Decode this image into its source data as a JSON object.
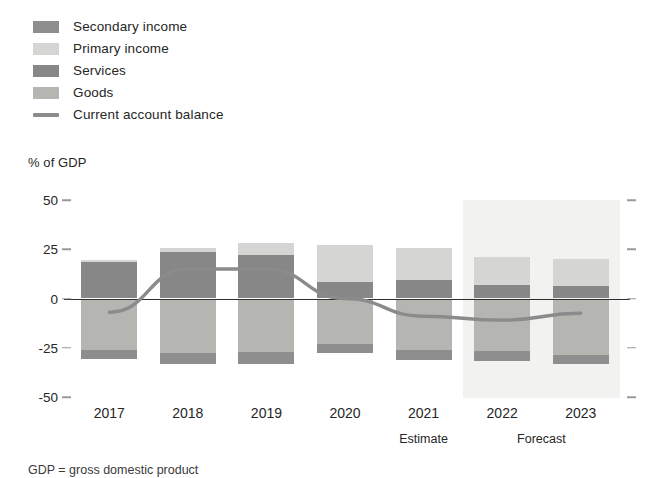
{
  "legend": {
    "items": [
      {
        "label": "Secondary income",
        "swatch": "#8e8e8e",
        "kind": "box",
        "icon": "legend-swatch-icon"
      },
      {
        "label": "Primary income",
        "swatch": "#d5d5d3",
        "kind": "box",
        "icon": "legend-swatch-icon"
      },
      {
        "label": "Services",
        "swatch": "#878787",
        "kind": "box",
        "icon": "legend-swatch-icon"
      },
      {
        "label": "Goods",
        "swatch": "#b5b5b2",
        "kind": "box",
        "icon": "legend-swatch-icon"
      },
      {
        "label": "Current account balance",
        "swatch": "#8b8b8b",
        "kind": "line",
        "icon": "legend-line-icon"
      }
    ]
  },
  "axis_title": "% of GDP",
  "footnote": "GDP = gross domestic product",
  "chart_data": {
    "type": "bar",
    "subtype": "stacked-bar-with-line",
    "title": "",
    "subtitle": "",
    "xlabel": "",
    "ylabel": "% of GDP",
    "ylim": [
      -50,
      50
    ],
    "yticks": [
      50,
      25,
      0,
      -25,
      -50
    ],
    "ytick_labels": [
      "50",
      "25",
      "0",
      "-25",
      "-50"
    ],
    "grid": false,
    "legend_position": "top-left",
    "categories": [
      "2017",
      "2018",
      "2019",
      "2020",
      "2021",
      "2022",
      "2023"
    ],
    "category_sublabels": [
      "",
      "",
      "",
      "",
      "Estimate",
      "Forecast",
      "Forecast"
    ],
    "annotations": [
      {
        "text": "Estimate",
        "category": "2021"
      },
      {
        "text": "Forecast",
        "categories": [
          "2022",
          "2023"
        ]
      }
    ],
    "shaded_region": {
      "from": "2022",
      "to": "2023",
      "label": "Forecast",
      "color": "#f2f2f0"
    },
    "series": [
      {
        "name": "Goods",
        "color": "#b5b5b2",
        "values": [
          -26.0,
          -27.5,
          -27.0,
          -23.0,
          -26.0,
          -26.5,
          -28.5
        ]
      },
      {
        "name": "Services",
        "color": "#878787",
        "values": [
          19.0,
          23.5,
          22.0,
          8.5,
          9.5,
          7.0,
          6.5
        ]
      },
      {
        "name": "Primary income",
        "color": "#d5d5d3",
        "values": [
          0.5,
          2.0,
          6.0,
          18.5,
          16.0,
          14.0,
          13.5
        ]
      },
      {
        "name": "Secondary income",
        "color": "#8e8e8e",
        "values": [
          -4.5,
          -5.5,
          -6.0,
          -4.5,
          -5.0,
          -5.0,
          -4.5
        ]
      }
    ],
    "line_series": {
      "name": "Current account balance",
      "color": "#8b8b8b",
      "values": [
        -7.0,
        15.0,
        15.0,
        0.0,
        -9.0,
        -11.0,
        -7.5
      ]
    },
    "bar_totals_positive": [
      24.0,
      39.0,
      42.0,
      27.0,
      25.5,
      21.0,
      20.0
    ],
    "bar_totals_negative": [
      -26.0,
      -27.5,
      -27.0,
      -27.5,
      -31.0,
      -31.5,
      -28.5
    ]
  }
}
